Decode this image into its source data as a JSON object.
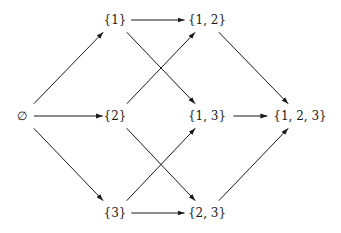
{
  "diagram": {
    "nodes": [
      {
        "id": "empty",
        "label": "∅",
        "x": 22,
        "y": 116
      },
      {
        "id": "s1",
        "label": "{1}",
        "x": 115,
        "y": 20
      },
      {
        "id": "s2",
        "label": "{2}",
        "x": 115,
        "y": 116
      },
      {
        "id": "s3",
        "label": "{3}",
        "x": 115,
        "y": 213
      },
      {
        "id": "s12",
        "label": "{1, 2}",
        "x": 207,
        "y": 20
      },
      {
        "id": "s13",
        "label": "{1, 3}",
        "x": 207,
        "y": 116
      },
      {
        "id": "s23",
        "label": "{2, 3}",
        "x": 207,
        "y": 213
      },
      {
        "id": "s123",
        "label": "{1, 2, 3}",
        "x": 300,
        "y": 116
      }
    ],
    "edges": [
      {
        "from": "empty",
        "to": "s1"
      },
      {
        "from": "empty",
        "to": "s2"
      },
      {
        "from": "empty",
        "to": "s3"
      },
      {
        "from": "s1",
        "to": "s12"
      },
      {
        "from": "s1",
        "to": "s13"
      },
      {
        "from": "s2",
        "to": "s12"
      },
      {
        "from": "s2",
        "to": "s23"
      },
      {
        "from": "s3",
        "to": "s13"
      },
      {
        "from": "s3",
        "to": "s23"
      },
      {
        "from": "s12",
        "to": "s123"
      },
      {
        "from": "s13",
        "to": "s123"
      },
      {
        "from": "s23",
        "to": "s123"
      }
    ],
    "colors": {
      "ink": "#1a1a1a",
      "background": "#ffffff"
    }
  }
}
